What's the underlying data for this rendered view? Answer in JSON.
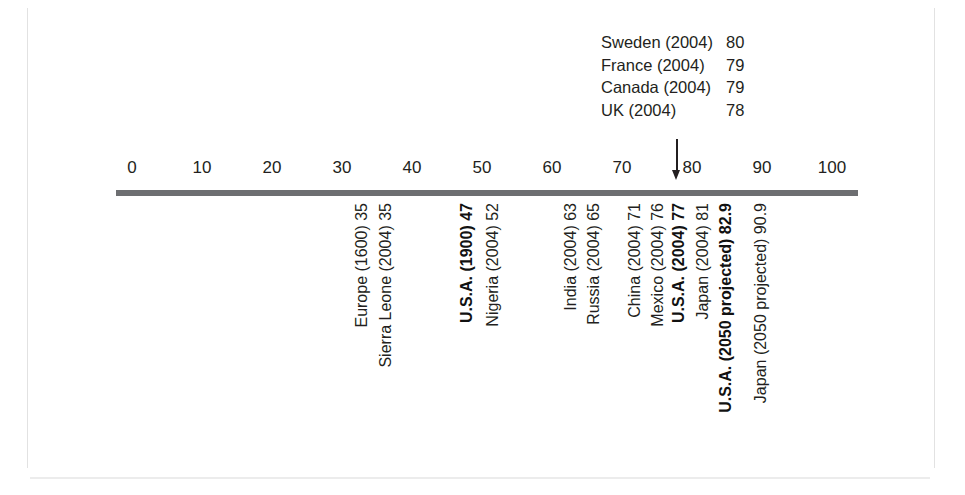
{
  "chart_data": {
    "type": "bar",
    "title": "",
    "subtitle": "",
    "xlabel": "",
    "ylabel": "",
    "xlim": [
      0,
      100
    ],
    "grid": false,
    "legend_position": "none",
    "axis": {
      "ticks": [
        0,
        10,
        20,
        30,
        40,
        50,
        60,
        70,
        80,
        90,
        100
      ],
      "tick_labels": [
        "0",
        "10",
        "20",
        "30",
        "40",
        "50",
        "60",
        "70",
        "80",
        "90",
        "100"
      ],
      "min": 0,
      "max": 100
    },
    "pointer": {
      "name": "down-arrow-marker",
      "value": 79.5
    },
    "callout": {
      "rows": [
        {
          "label": "Sweden (2004)",
          "value": "80"
        },
        {
          "label": "France (2004)",
          "value": "79"
        },
        {
          "label": "Canada (2004)",
          "value": "79"
        },
        {
          "label": "UK (2004)",
          "value": "78"
        }
      ]
    },
    "categories": [
      "Europe (1600)",
      "Sierra Leone (2004)",
      "U.S.A. (1900)",
      "Nigeria (2004)",
      "India (2004)",
      "Russia (2004)",
      "China (2004)",
      "Mexico (2004)",
      "U.S.A. (2004)",
      "Japan (2004)",
      "U.S.A. (2050 projected)",
      "Japan (2050 projected)"
    ],
    "values": [
      35,
      35,
      47,
      52,
      63,
      65,
      71,
      76,
      77,
      81,
      82.9,
      90.9
    ],
    "points": [
      {
        "label": "Europe (1600) 35",
        "name": "Europe (1600)",
        "value": 35,
        "x": 353,
        "bold": false
      },
      {
        "label": "Sierra Leone (2004) 35",
        "name": "Sierra Leone (2004)",
        "value": 35,
        "x": 377,
        "bold": false
      },
      {
        "label": "U.S.A. (1900) 47",
        "name": "U.S.A. (1900)",
        "value": 47,
        "x": 458,
        "bold": true
      },
      {
        "label": "Nigeria (2004) 52",
        "name": "Nigeria (2004)",
        "value": 52,
        "x": 484,
        "bold": false
      },
      {
        "label": "India (2004) 63",
        "name": "India (2004)",
        "value": 63,
        "x": 562,
        "bold": false
      },
      {
        "label": "Russia (2004) 65",
        "name": "Russia (2004)",
        "value": 65,
        "x": 585,
        "bold": false
      },
      {
        "label": "China (2004) 71",
        "name": "China (2004)",
        "value": 71,
        "x": 626,
        "bold": false
      },
      {
        "label": "Mexico (2004) 76",
        "name": "Mexico (2004)",
        "value": 76,
        "x": 649,
        "bold": false
      },
      {
        "label": "U.S.A. (2004) 77",
        "name": "U.S.A. (2004)",
        "value": 77,
        "x": 670,
        "bold": true
      },
      {
        "label": "Japan (2004) 81",
        "name": "Japan (2004)",
        "value": 81,
        "x": 694,
        "bold": false
      },
      {
        "label": "U.S.A. (2050 projected) 82.9",
        "name": "U.S.A. (2050 projected)",
        "value": 82.9,
        "x": 717,
        "bold": true
      },
      {
        "label": "Japan (2050 projected) 90.9",
        "name": "Japan (2050 projected)",
        "value": 90.9,
        "x": 752,
        "bold": false
      }
    ]
  },
  "colors": {
    "axis": "#6d6e71",
    "text": "#231f20",
    "frame": "#e2e2e2"
  }
}
